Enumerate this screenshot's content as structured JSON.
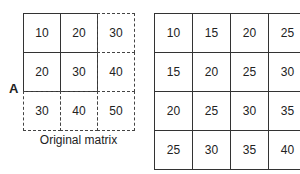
{
  "left_matrix": {
    "label": "A",
    "caption": "Original matrix",
    "rows": [
      [
        "10",
        "20",
        "30"
      ],
      [
        "20",
        "30",
        "40"
      ],
      [
        "30",
        "40",
        "50"
      ]
    ],
    "solid_region": "top-left 2x2"
  },
  "right_matrix": {
    "rows": [
      [
        "10",
        "15",
        "20",
        "25"
      ],
      [
        "15",
        "20",
        "25",
        "30"
      ],
      [
        "20",
        "25",
        "30",
        "35"
      ],
      [
        "25",
        "30",
        "35",
        "40"
      ]
    ]
  }
}
